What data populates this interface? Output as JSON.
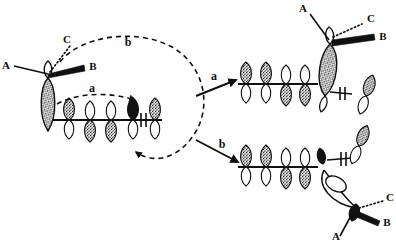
{
  "figure": {
    "background_color": "#ffffff",
    "ink_color": "#101010",
    "stipple_color": "#2b2b2b"
  },
  "structures": {
    "left": {
      "name": "starting-allylic-system",
      "substituent_labels": {
        "a_label": "A",
        "b_label": "B",
        "c_label": "C"
      },
      "bond_styles": {
        "a_bond": "plain-line",
        "b_bond": "bold-wedge",
        "c_bond": "dotted-hash"
      },
      "orbital_count": 6,
      "orbital_phases": [
        "up-filled",
        "up-filled",
        "down-filled",
        "down-filled",
        "up-solid",
        "up-filled"
      ],
      "electron_marker": "double-tick"
    },
    "top_right": {
      "name": "product-pathway-a",
      "substituent_labels": {
        "a_label": "A",
        "b_label": "B",
        "c_label": "C"
      },
      "bond_styles": {
        "a_bond": "plain-line",
        "b_bond": "bold-wedge",
        "c_bond": "dotted-hash"
      },
      "orbital_count": 5,
      "orbital_phases": [
        "up-filled",
        "up-filled",
        "down-filled",
        "down-filled",
        "up-filled"
      ],
      "electron_marker": "double-tick"
    },
    "bottom_right": {
      "name": "product-pathway-b",
      "substituent_labels": {
        "a_label": "A",
        "b_label": "B",
        "c_label": "C"
      },
      "bond_styles": {
        "a_bond": "plain-line",
        "b_bond": "bold-wedge",
        "c_bond": "dotted-hash"
      },
      "orbital_count": 5,
      "orbital_phases": [
        "up-filled",
        "up-filled",
        "down-filled",
        "down-filled",
        "up-solid"
      ],
      "electron_marker": "double-tick"
    }
  },
  "pathways": {
    "a": {
      "label": "a",
      "curve_label": "a",
      "arrow_label": "a",
      "style": "dashed",
      "description": "short dashed arc over orbital chain"
    },
    "b": {
      "label": "b",
      "curve_label": "b",
      "arrow_label": "b",
      "style": "dashed",
      "description": "long dashed loop around to chain terminus"
    }
  },
  "annotations": {
    "curve_a_label": "a",
    "curve_b_label": "b",
    "transition_a_label": "a",
    "transition_b_label": "b"
  }
}
